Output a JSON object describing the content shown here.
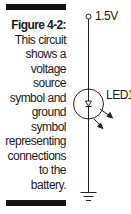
{
  "figure": {
    "title": "Figure 4-2:",
    "caption_lines": [
      "This circuit",
      "shows a",
      "voltage",
      "source",
      "symbol and",
      "ground",
      "symbol",
      "representing",
      "connections",
      "to the",
      "battery."
    ]
  },
  "schematic": {
    "voltage_source": {
      "label": "1.5V",
      "icon": "terminal-circle-icon"
    },
    "led": {
      "label": "LED1",
      "icon": "led-diode-icon"
    },
    "ground": {
      "icon": "ground-icon"
    }
  },
  "colors": {
    "ink": "#111111",
    "background": "#ffffff"
  }
}
